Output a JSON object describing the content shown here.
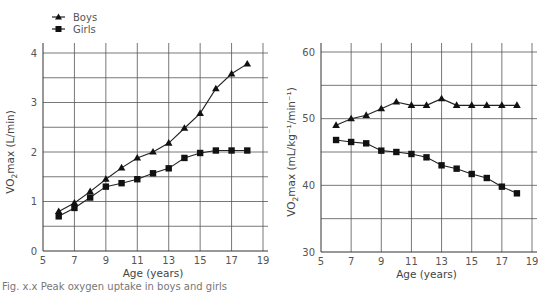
{
  "legend": {
    "boys": "Boys",
    "girls": "Girls"
  },
  "caption": "Fig. x.x Peak oxygen uptake in boys and girls",
  "chart_data": [
    {
      "type": "line",
      "title": "",
      "xlabel": "Age (years)",
      "ylabel": "VO2max (L/min)",
      "ylabel_main": "VO",
      "ylabel_sub": "2",
      "ylabel_rest": "max (L/min)",
      "xlim": [
        5,
        19
      ],
      "ylim": [
        0,
        4
      ],
      "xticks": [
        5,
        7,
        9,
        11,
        13,
        15,
        17,
        19
      ],
      "yticks": [
        0,
        1,
        2,
        3,
        4
      ],
      "grid": true,
      "legend_position": "top-left",
      "x": [
        6,
        7,
        8,
        9,
        10,
        11,
        12,
        13,
        14,
        15,
        16,
        17,
        18
      ],
      "series": [
        {
          "name": "Boys",
          "marker": "triangle",
          "values": [
            0.8,
            0.97,
            1.2,
            1.45,
            1.68,
            1.88,
            2.0,
            2.18,
            2.48,
            2.78,
            3.28,
            3.58,
            3.78
          ]
        },
        {
          "name": "Girls",
          "marker": "square",
          "values": [
            0.7,
            0.87,
            1.08,
            1.3,
            1.37,
            1.45,
            1.57,
            1.67,
            1.88,
            1.98,
            2.03,
            2.03,
            2.03
          ]
        }
      ]
    },
    {
      "type": "line",
      "title": "",
      "xlabel": "Age (years)",
      "ylabel": "VO2max (mL/kg-1/min-1)",
      "ylabel_main": "VO",
      "ylabel_sub": "2",
      "ylabel_rest": "max (mL/kg⁻¹/min⁻¹)",
      "xlim": [
        5,
        19
      ],
      "ylim": [
        30,
        60
      ],
      "xticks": [
        5,
        7,
        9,
        11,
        13,
        15,
        17,
        19
      ],
      "yticks": [
        30,
        40,
        50,
        60
      ],
      "grid": true,
      "x": [
        6,
        7,
        8,
        9,
        10,
        11,
        12,
        13,
        14,
        15,
        16,
        17,
        18
      ],
      "series": [
        {
          "name": "Boys",
          "marker": "triangle",
          "values": [
            49,
            50,
            50.5,
            51.5,
            52.5,
            52,
            52,
            53,
            52,
            52,
            52,
            52,
            52
          ]
        },
        {
          "name": "Girls",
          "marker": "square",
          "values": [
            46.8,
            46.5,
            46.3,
            45.2,
            45,
            44.7,
            44.2,
            43,
            42.5,
            41.7,
            41.1,
            39.8,
            38.8
          ]
        }
      ]
    }
  ]
}
